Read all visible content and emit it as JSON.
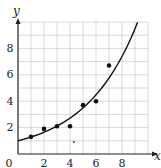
{
  "chart_data": {
    "type": "scatter",
    "title": "",
    "xlabel": "x",
    "ylabel": "y",
    "xlim": [
      0,
      10
    ],
    "ylim": [
      0,
      10
    ],
    "grid": true,
    "x_ticks": [
      0,
      2,
      4,
      6,
      8
    ],
    "y_ticks": [
      2,
      4,
      6,
      8
    ],
    "series": [
      {
        "name": "data points",
        "marker": "filled-circle",
        "points": [
          {
            "x": 1,
            "y": 1.3
          },
          {
            "x": 2,
            "y": 1.9
          },
          {
            "x": 3,
            "y": 2.1
          },
          {
            "x": 4,
            "y": 2.1
          },
          {
            "x": 5,
            "y": 3.7
          },
          {
            "x": 6,
            "y": 4.0
          },
          {
            "x": 7,
            "y": 6.7
          }
        ]
      },
      {
        "name": "annotation mark",
        "marker": "small-asterisk",
        "points": [
          {
            "x": 4.3,
            "y": 0.9
          }
        ]
      },
      {
        "name": "exponential fit curve",
        "type": "line",
        "function": "y = e^(0.25x)",
        "a": 1.0,
        "b": 0.25,
        "x_range": [
          0,
          9.2
        ]
      }
    ]
  },
  "labels": {
    "x_axis": "x",
    "y_axis": "y",
    "origin": "0",
    "x_tick_labels": [
      "2",
      "4",
      "6",
      "8"
    ],
    "y_tick_labels": [
      "2",
      "4",
      "6",
      "8"
    ]
  },
  "colors": {
    "grid": "#c8c8c8",
    "axis": "#222222",
    "points": "#111111",
    "curve": "#111111"
  }
}
